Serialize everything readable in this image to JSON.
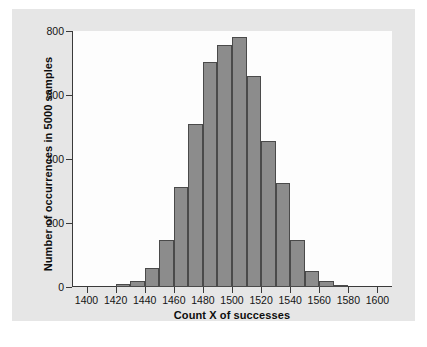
{
  "figure": {
    "background_color": "#ffffff",
    "panel_color": "#e6e6e6",
    "plot_background": "#fdfdfd",
    "bar_fill": "#8c8c8c",
    "bar_stroke": "#4a4a4a",
    "axis_color": "#3a3a3a",
    "caption_partial": ""
  },
  "chart_data": {
    "type": "bar",
    "title": "",
    "subtitle": "",
    "xlabel": "Count X of successes",
    "ylabel": "Number of occurrences in 5000 samples",
    "xlim": [
      1390,
      1610
    ],
    "ylim": [
      0,
      800
    ],
    "xticks": [
      1400,
      1420,
      1440,
      1460,
      1480,
      1500,
      1520,
      1540,
      1560,
      1580,
      1600
    ],
    "xticklabels": [
      "1400",
      "1420",
      "1440",
      "1460",
      "1480",
      "1500",
      "1520",
      "1540",
      "1560",
      "1580",
      "1600"
    ],
    "yticks": [
      0,
      200,
      400,
      600,
      800
    ],
    "yticklabels": [
      "0",
      "200",
      "400",
      "600",
      "800"
    ],
    "grid": false,
    "legend": false,
    "bin_width": 10,
    "bin_edges": [
      1420,
      1430,
      1440,
      1450,
      1460,
      1470,
      1480,
      1490,
      1500,
      1510,
      1520,
      1530,
      1540,
      1550,
      1560,
      1570,
      1580
    ],
    "categories": [
      "1420-1430",
      "1430-1440",
      "1440-1450",
      "1450-1460",
      "1460-1470",
      "1470-1480",
      "1480-1490",
      "1490-1500",
      "1500-1510",
      "1510-1520",
      "1520-1530",
      "1530-1540",
      "1540-1550",
      "1550-1560",
      "1560-1570",
      "1570-1580"
    ],
    "values": [
      8,
      20,
      58,
      148,
      312,
      508,
      702,
      756,
      782,
      658,
      455,
      325,
      148,
      50,
      18,
      6
    ]
  }
}
